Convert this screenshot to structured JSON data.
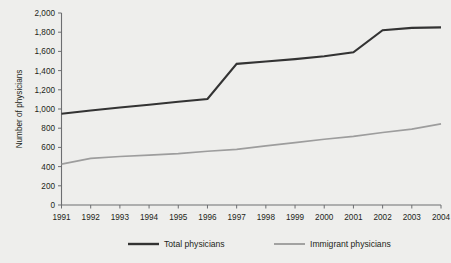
{
  "chart_data": {
    "type": "line",
    "title": "",
    "xlabel": "",
    "ylabel": "Number of physicians",
    "categories": [
      "1991",
      "1992",
      "1993",
      "1994",
      "1995",
      "1996",
      "1997",
      "1998",
      "1999",
      "2000",
      "2001",
      "2002",
      "2003",
      "2004"
    ],
    "x": [
      1991,
      1992,
      1993,
      1994,
      1995,
      1996,
      1997,
      1998,
      1999,
      2000,
      2001,
      2002,
      2003,
      2004
    ],
    "ylim": [
      0,
      2000
    ],
    "ytick_labels": [
      "0",
      "200",
      "400",
      "600",
      "800",
      "1,000",
      "1,200",
      "1,400",
      "1,600",
      "1,800",
      "2,000"
    ],
    "ytick_values": [
      0,
      200,
      400,
      600,
      800,
      1000,
      1200,
      1400,
      1600,
      1800,
      2000
    ],
    "xtick_labels": [
      "1991",
      "1992",
      "1993",
      "1994",
      "1995",
      "1996",
      "1997",
      "1998",
      "1999",
      "2000",
      "2001",
      "2002",
      "2003",
      "2004"
    ],
    "grid": false,
    "legend_position": "bottom",
    "series": [
      {
        "name": "Total physicians",
        "color": "#333333",
        "values": [
          950,
          985,
          1015,
          1045,
          1075,
          1105,
          1470,
          1495,
          1520,
          1550,
          1590,
          1820,
          1845,
          1850
        ]
      },
      {
        "name": "Immigrant physicians",
        "color": "#9d9d9d",
        "values": [
          425,
          485,
          505,
          520,
          535,
          560,
          580,
          615,
          650,
          685,
          715,
          755,
          790,
          845
        ]
      }
    ]
  },
  "legend": {
    "items": [
      {
        "label": "Total physicians",
        "color": "#333333"
      },
      {
        "label": "Immigrant physicians",
        "color": "#9d9d9d"
      }
    ]
  },
  "axes": {
    "y_title": "Number of physicians"
  }
}
